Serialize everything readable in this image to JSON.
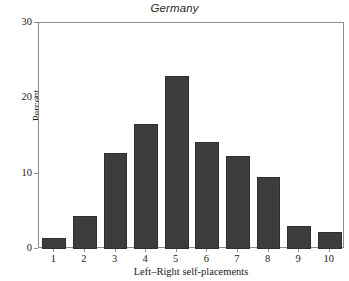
{
  "chart_data": {
    "type": "bar",
    "title": "Germany",
    "xlabel": "Left–Right self-placements",
    "ylabel": "Percent",
    "categories": [
      "1",
      "2",
      "3",
      "4",
      "5",
      "6",
      "7",
      "8",
      "9",
      "10"
    ],
    "values": [
      1.5,
      4.4,
      12.7,
      16.6,
      23.0,
      14.2,
      12.3,
      9.6,
      3.0,
      2.2
    ],
    "ylim": [
      0,
      30
    ],
    "yticks": [
      0,
      10,
      20,
      30
    ],
    "ytick_labels": [
      "0",
      "10",
      "20",
      "30"
    ],
    "grid": false,
    "legend": "none",
    "bar_color": "#3d3d3d",
    "frame_color": "#8d8d8d",
    "background": "#ffffff"
  }
}
